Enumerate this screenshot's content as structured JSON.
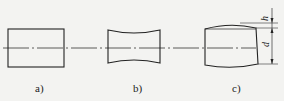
{
  "figure": {
    "panels": [
      {
        "id": "a",
        "label": "a)",
        "shape": "rectangle"
      },
      {
        "id": "b",
        "label": "b)",
        "shape": "concave-barrel"
      },
      {
        "id": "c",
        "label": "c)",
        "shape": "convex-top-barrel"
      }
    ],
    "dimensions": {
      "h": "h",
      "d": "d"
    },
    "colors": {
      "line": "#222222",
      "background": "#f3f3f1"
    }
  }
}
